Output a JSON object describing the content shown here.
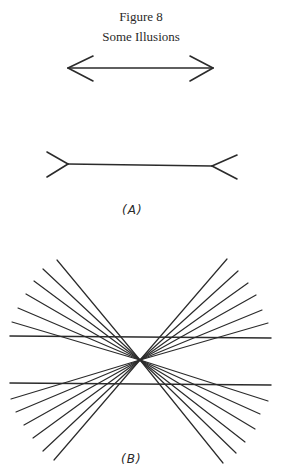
{
  "figure": {
    "title": "Figure 8",
    "subtitle": "Some Illusions"
  },
  "panels": [
    {
      "id": "A",
      "label": "(A)",
      "description": "Müller-Lyer illusion: two equal-length shafts, one with inward-pointing arrowheads, one with outward-pointing fins"
    },
    {
      "id": "B",
      "label": "(B)",
      "description": "Hering illusion: two parallel horizontal lines crossed by rays radiating from a central point",
      "ray_count_per_side": 6,
      "horizontal_line_count": 2
    }
  ],
  "colors": {
    "ink": "#2b2b2b",
    "background": "#ffffff"
  }
}
